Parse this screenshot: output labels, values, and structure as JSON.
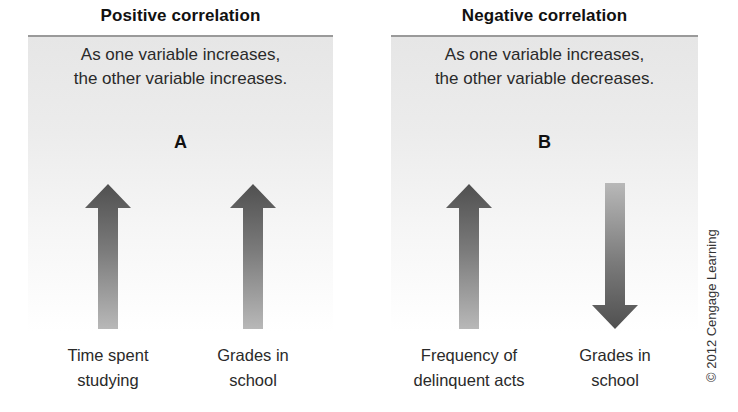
{
  "panels": [
    {
      "id": "positive",
      "title": "Positive correlation",
      "description_line1": "As one variable increases,",
      "description_line2": "the other variable increases.",
      "letter": "A",
      "variables": [
        {
          "label_line1": "Time spent",
          "label_line2": "studying",
          "direction": "up",
          "icon": "arrow-up-icon"
        },
        {
          "label_line1": "Grades in",
          "label_line2": "school",
          "direction": "up",
          "icon": "arrow-up-icon"
        }
      ]
    },
    {
      "id": "negative",
      "title": "Negative correlation",
      "description_line1": "As one variable increases,",
      "description_line2": "the other variable decreases.",
      "letter": "B",
      "variables": [
        {
          "label_line1": "Frequency of",
          "label_line2": "delinquent acts",
          "direction": "up",
          "icon": "arrow-up-icon"
        },
        {
          "label_line1": "Grades in",
          "label_line2": "school",
          "direction": "down",
          "icon": "arrow-down-icon"
        }
      ]
    }
  ],
  "copyright": "© 2012 Cengage Learning",
  "colors": {
    "arrow_dark": "#555555",
    "arrow_light": "#b5b5b5",
    "panel_rule": "#9a9a9a",
    "panel_bg_top": "#e6e6e6"
  }
}
